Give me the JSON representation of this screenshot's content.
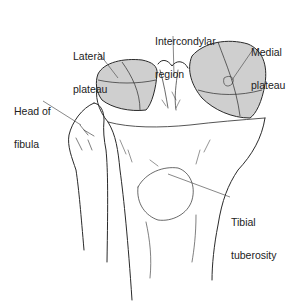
{
  "figure": {
    "colors": {
      "line": "#2a2a2a",
      "plateau_fill": "#cfcfcf",
      "leader": "#555555",
      "background": "#ffffff"
    }
  },
  "labels": {
    "lateral_plateau": {
      "line1": "Lateral",
      "line2": "plateau"
    },
    "intercondylar_region": {
      "line1": "Intercondylar",
      "line2": "region"
    },
    "medial_plateau": {
      "line1": "Medial",
      "line2": "plateau"
    },
    "head_of_fibula": {
      "line1": "Head of",
      "line2": "fibula"
    },
    "tibial_tuberosity": {
      "line1": "Tibial",
      "line2": "tuberosity"
    }
  }
}
